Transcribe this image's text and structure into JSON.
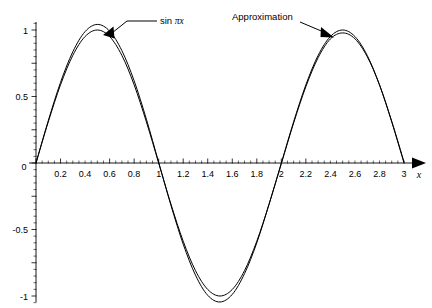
{
  "chart_data": {
    "type": "line",
    "title": "",
    "subtitle": "",
    "xlabel": "x",
    "ylabel": "",
    "xlim": [
      0,
      3.05
    ],
    "ylim": [
      -1.1,
      1.1
    ],
    "grid": false,
    "legend_position": "inline-annotations",
    "x_ticks": [
      "0.2",
      "0.4",
      "0.6",
      "0.8",
      "1",
      "1.2",
      "1.4",
      "1.6",
      "1.8",
      "2",
      "2.2",
      "2.4",
      "2.6",
      "2.8",
      "3"
    ],
    "x_tick_values": [
      0.2,
      0.4,
      0.6,
      0.8,
      1,
      1.2,
      1.4,
      1.6,
      1.8,
      2,
      2.2,
      2.4,
      2.6,
      2.8,
      3
    ],
    "y_ticks": [
      "1",
      "0.5",
      "0",
      "-0.5",
      "-1"
    ],
    "y_tick_values": [
      1,
      0.5,
      0,
      -0.5,
      -1
    ],
    "x_minor_step": 0.05,
    "y_minor_step": 0.05,
    "origin_label": "0",
    "series": [
      {
        "name": "sin πx",
        "color": "#000000",
        "x": [
          0,
          0.1,
          0.2,
          0.3,
          0.4,
          0.5,
          0.6,
          0.7,
          0.8,
          0.9,
          1.0,
          1.1,
          1.2,
          1.3,
          1.4,
          1.5,
          1.6,
          1.7,
          1.8,
          1.9,
          2.0,
          2.1,
          2.2,
          2.3,
          2.4,
          2.5,
          2.6,
          2.7,
          2.8,
          2.9,
          3.0
        ],
        "values": [
          0,
          0.309,
          0.588,
          0.809,
          0.951,
          1.0,
          0.951,
          0.809,
          0.588,
          0.309,
          0,
          -0.309,
          -0.588,
          -0.809,
          -0.951,
          -1.0,
          -0.951,
          -0.809,
          -0.588,
          -0.309,
          0,
          0.309,
          0.588,
          0.809,
          0.951,
          1.0,
          0.951,
          0.809,
          0.588,
          0.309,
          0
        ]
      },
      {
        "name": "Approximation",
        "color": "#000000",
        "x": [
          0,
          0.1,
          0.2,
          0.3,
          0.4,
          0.5,
          0.6,
          0.7,
          0.8,
          0.9,
          1.0,
          1.1,
          1.2,
          1.3,
          1.4,
          1.5,
          1.6,
          1.7,
          1.8,
          1.9,
          2.0,
          2.1,
          2.2,
          2.3,
          2.4,
          2.5,
          2.6,
          2.7,
          2.8,
          2.9,
          3.0
        ],
        "values": [
          0,
          0.318,
          0.606,
          0.836,
          0.988,
          1.042,
          0.992,
          0.845,
          0.618,
          0.329,
          0.005,
          -0.318,
          -0.61,
          -0.843,
          -0.995,
          -1.045,
          -0.988,
          -0.832,
          -0.6,
          -0.31,
          -0.005,
          0.3,
          0.574,
          0.792,
          0.933,
          0.978,
          0.934,
          0.8,
          0.588,
          0.314,
          0.008
        ]
      }
    ],
    "annotations": [
      {
        "id": "sin-label",
        "text": "sin πx",
        "text_parts": {
          "leading": "sin ",
          "pi": "π",
          "var": "x"
        },
        "points_to_series": "sin πx",
        "target_x": 0.58,
        "target_y": 0.97
      },
      {
        "id": "approximation-label",
        "text": "Approximation",
        "points_to_series": "Approximation",
        "target_x": 2.46,
        "target_y": 0.99
      }
    ]
  },
  "axes": {
    "x_axis_name": "x",
    "arrow": "right-arrowhead"
  }
}
